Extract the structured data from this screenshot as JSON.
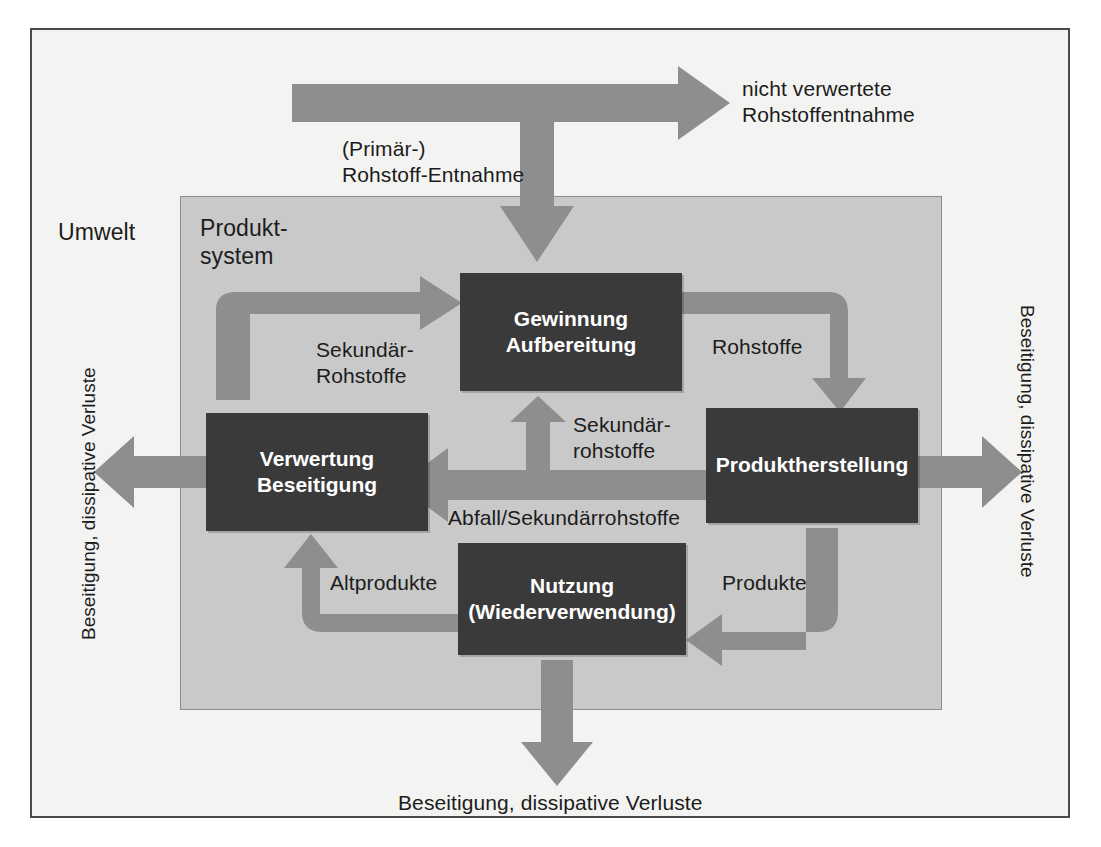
{
  "diagram": {
    "zones": {
      "environment_label": "Umwelt",
      "product_system_label": "Produkt-\nsystem"
    },
    "processes": [
      {
        "id": "gewinnung",
        "label": "Gewinnung\nAufbereitung"
      },
      {
        "id": "produktherstellung",
        "label": "Produktherstellung"
      },
      {
        "id": "nutzung",
        "label": "Nutzung\n(Wiederverwendung)"
      },
      {
        "id": "verwertung",
        "label": "Verwertung\nBeseitigung"
      }
    ],
    "flow_labels": [
      {
        "id": "nicht-verwertete",
        "text": "nicht verwertete\nRohstoffentnahme"
      },
      {
        "id": "primaer-rohstoff",
        "text": "(Primär-)\nRohstoff-Entnahme"
      },
      {
        "id": "sekundaer-rohstoffe-l",
        "text": "Sekundär-\nRohstoffe"
      },
      {
        "id": "rohstoffe",
        "text": "Rohstoffe"
      },
      {
        "id": "sekundaerrohstoffe-m",
        "text": "Sekundär-\nrohstoffe"
      },
      {
        "id": "abfall-sekundaer",
        "text": "Abfall/Sekundärrohstoffe"
      },
      {
        "id": "produkte",
        "text": "Produkte"
      },
      {
        "id": "altprodukte",
        "text": "Altprodukte"
      },
      {
        "id": "beseitigung-unten",
        "text": "Beseitigung, dissipative Verluste"
      },
      {
        "id": "beseitigung-links",
        "text": "Beseitigung, dissipative Verluste"
      },
      {
        "id": "beseitigung-rechts",
        "text": "Beseitigung, dissipative Verluste"
      }
    ],
    "colors": {
      "arrow": "#8e8e8e",
      "process_box": "#3a3a3a",
      "process_text": "#ffffff",
      "inner_zone": "#c9c9c9",
      "outer_zone": "#f3f3f1",
      "frame_border": "#4a4a4a",
      "label_text": "#1c1c1c"
    }
  }
}
